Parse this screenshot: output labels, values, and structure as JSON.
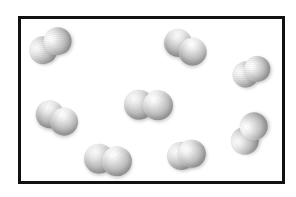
{
  "figure": {
    "kind": "particle-diagram",
    "caption": "",
    "title": "",
    "background_color": "#ffffff"
  },
  "container": {
    "label": "",
    "border_color": "#111111",
    "fill_color": "#ffffff",
    "border_width_px": 3,
    "x": 18,
    "y": 16,
    "width": 267,
    "height": 168
  },
  "particles": {
    "count": 8,
    "atoms_per_particle": 2,
    "species_label": "",
    "highlight_color": "#ffffff",
    "shadow_color": "#9d9d9d",
    "items": [
      {
        "id": "molecule-1",
        "position_label": "top-left",
        "x": 50,
        "y": 46,
        "rotation_deg": -32,
        "atom_radius": 14,
        "separation": 17
      },
      {
        "id": "molecule-2",
        "position_label": "top-center",
        "x": 185,
        "y": 47,
        "rotation_deg": 31,
        "atom_radius": 14,
        "separation": 17
      },
      {
        "id": "molecule-3",
        "position_label": "top-right",
        "x": 251,
        "y": 72,
        "rotation_deg": -26,
        "atom_radius": 13,
        "separation": 13
      },
      {
        "id": "molecule-4",
        "position_label": "middle-left",
        "x": 57,
        "y": 118,
        "rotation_deg": 27,
        "atom_radius": 14,
        "separation": 16
      },
      {
        "id": "molecule-5",
        "position_label": "center",
        "x": 148,
        "y": 105,
        "rotation_deg": 2,
        "atom_radius": 15,
        "separation": 19
      },
      {
        "id": "molecule-6",
        "position_label": "middle-right",
        "x": 249,
        "y": 134,
        "rotation_deg": -58,
        "atom_radius": 14,
        "separation": 17
      },
      {
        "id": "molecule-7",
        "position_label": "bottom-left",
        "x": 108,
        "y": 160,
        "rotation_deg": 8,
        "atom_radius": 15,
        "separation": 18
      },
      {
        "id": "molecule-8",
        "position_label": "bottom-center",
        "x": 186,
        "y": 155,
        "rotation_deg": -12,
        "atom_radius": 14,
        "separation": 11
      }
    ]
  }
}
